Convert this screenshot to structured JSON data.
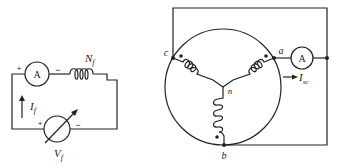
{
  "left_circuit": {
    "ammeter_label": "A",
    "ammeter_plus": "+",
    "ammeter_minus": "−",
    "coil_label": "N",
    "coil_sub": "f",
    "current_label": "I",
    "current_sub": "f",
    "voltmeter_plus": "+",
    "voltmeter_minus": "−",
    "voltage_label": "V",
    "voltage_sub": "f"
  },
  "right_circuit": {
    "node_a": "a",
    "node_b": "b",
    "node_c": "c",
    "node_n": "n",
    "ammeter_label": "A",
    "current_label": "I",
    "current_sub": "sc"
  },
  "colors": {
    "line": "#222222",
    "background": "#ffffff"
  }
}
